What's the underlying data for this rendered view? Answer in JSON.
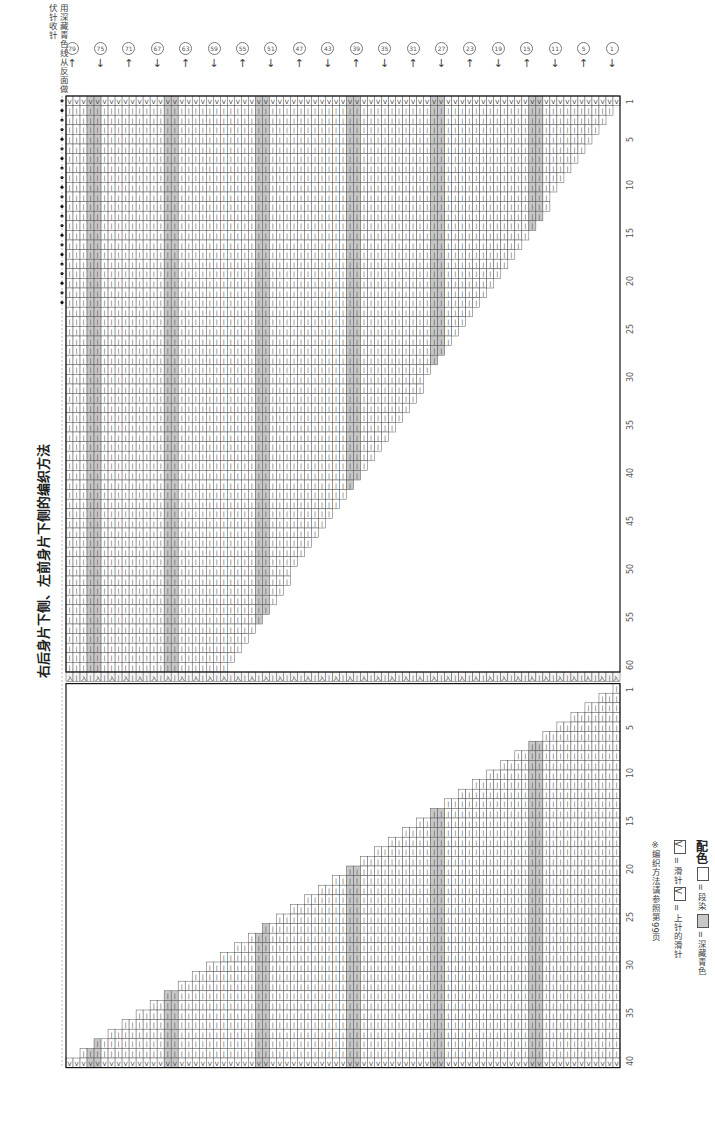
{
  "title": "右后身片下侧、左前身片下侧的编织方法",
  "top_note": "用深藏青色线从反面做伏针收针",
  "row_markers": [
    {
      "label": "79",
      "dir": "up"
    },
    {
      "label": "75",
      "dir": "down"
    },
    {
      "label": "71",
      "dir": "up"
    },
    {
      "label": "67",
      "dir": "down"
    },
    {
      "label": "63",
      "dir": "up"
    },
    {
      "label": "59",
      "dir": "down"
    },
    {
      "label": "55",
      "dir": "up"
    },
    {
      "label": "51",
      "dir": "down"
    },
    {
      "label": "47",
      "dir": "up"
    },
    {
      "label": "43",
      "dir": "down"
    },
    {
      "label": "39",
      "dir": "up"
    },
    {
      "label": "35",
      "dir": "down"
    },
    {
      "label": "31",
      "dir": "up"
    },
    {
      "label": "27",
      "dir": "down"
    },
    {
      "label": "23",
      "dir": "up"
    },
    {
      "label": "19",
      "dir": "down"
    },
    {
      "label": "15",
      "dir": "up"
    },
    {
      "label": "11",
      "dir": "down"
    },
    {
      "label": "5",
      "dir": "up"
    },
    {
      "label": "1",
      "dir": "down"
    }
  ],
  "upper_axis": [
    "1",
    "5",
    "10",
    "15",
    "20",
    "25",
    "30",
    "35",
    "40",
    "45",
    "50",
    "55",
    "60"
  ],
  "lower_axis": [
    "1",
    "5",
    "10",
    "15",
    "20",
    "25",
    "30",
    "35",
    "40"
  ],
  "legend": {
    "knit_symbol": "丨",
    "knit_eq": "□ = 丨",
    "color_label": "配色",
    "color_a": "= 段染",
    "color_b": "= 深藏青色",
    "slip_label": "= 滑针",
    "purl_slip_label": "= 上针的滑针",
    "reference": "※编织方法请参照第99页"
  },
  "colors": {
    "grid_line": "#555555",
    "shade": "#c8c8c8",
    "border": "#111111"
  }
}
